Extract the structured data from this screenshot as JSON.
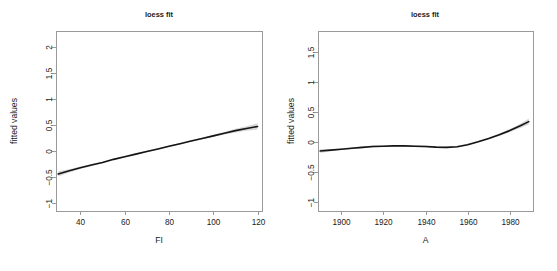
{
  "figure": {
    "background": "#ffffff",
    "line_color": "#141414",
    "band_color": "#c9c9c9",
    "axis_color": "#9a9a9a",
    "text_color": "#1a1a1a"
  },
  "panels": [
    {
      "id": "left",
      "title": "loess fit",
      "xlabel": "FI",
      "ylabel": "fitted values",
      "xticks": [
        "40",
        "60",
        "80",
        "100",
        "120"
      ],
      "yticks": [
        "2.0",
        "1.5",
        "1.0",
        "0.5",
        "0.0",
        "-0.5",
        "-1.0"
      ]
    },
    {
      "id": "right",
      "title": "loess fit",
      "xlabel": "A",
      "ylabel": "fitted values",
      "xticks": [
        "1900",
        "1920",
        "1940",
        "1960",
        "1980"
      ],
      "yticks": [
        "1.5",
        "1.0",
        "0.5",
        "0.0",
        "-0.5",
        "-1.0"
      ]
    }
  ],
  "chart_data": [
    {
      "type": "line",
      "panel": "left",
      "title": "loess fit",
      "xlabel": "FI",
      "ylabel": "fitted values",
      "xlim": [
        29,
        122
      ],
      "ylim": [
        -1.15,
        2.3
      ],
      "xticks": [
        40,
        60,
        80,
        100,
        120
      ],
      "yticks": [
        2.0,
        1.5,
        1.0,
        0.5,
        0.0,
        -0.5,
        -1.0
      ],
      "grid": false,
      "legend": "none",
      "series": [
        {
          "name": "loess fitted values",
          "x": [
            30,
            35,
            40,
            45,
            50,
            55,
            60,
            65,
            70,
            75,
            80,
            85,
            90,
            95,
            100,
            105,
            110,
            115,
            120
          ],
          "y": [
            -0.44,
            -0.38,
            -0.32,
            -0.27,
            -0.22,
            -0.16,
            -0.11,
            -0.06,
            -0.01,
            0.04,
            0.09,
            0.14,
            0.19,
            0.24,
            0.29,
            0.34,
            0.39,
            0.43,
            0.47
          ],
          "ci_lower": [
            -0.49,
            -0.41,
            -0.345,
            -0.29,
            -0.235,
            -0.175,
            -0.125,
            -0.075,
            -0.025,
            0.025,
            0.075,
            0.125,
            0.175,
            0.225,
            0.27,
            0.315,
            0.355,
            0.39,
            0.41
          ],
          "ci_upper": [
            -0.39,
            -0.35,
            -0.295,
            -0.25,
            -0.205,
            -0.145,
            -0.095,
            -0.045,
            0.005,
            0.055,
            0.105,
            0.155,
            0.205,
            0.255,
            0.31,
            0.365,
            0.425,
            0.475,
            0.53
          ]
        }
      ]
    },
    {
      "type": "line",
      "panel": "right",
      "title": "loess fit",
      "xlabel": "A",
      "ylabel": "fitted values",
      "xlim": [
        1889,
        1991
      ],
      "ylim": [
        -1.15,
        1.85
      ],
      "xticks": [
        1900,
        1920,
        1940,
        1960,
        1980
      ],
      "yticks": [
        1.5,
        1.0,
        0.5,
        0.0,
        -0.5,
        -1.0
      ],
      "grid": false,
      "legend": "none",
      "series": [
        {
          "name": "loess fitted values",
          "x": [
            1890,
            1895,
            1900,
            1905,
            1910,
            1915,
            1920,
            1925,
            1930,
            1935,
            1940,
            1945,
            1950,
            1955,
            1960,
            1965,
            1970,
            1975,
            1980,
            1985,
            1989
          ],
          "y": [
            -0.15,
            -0.135,
            -0.12,
            -0.105,
            -0.09,
            -0.075,
            -0.07,
            -0.065,
            -0.065,
            -0.07,
            -0.075,
            -0.085,
            -0.09,
            -0.08,
            -0.045,
            0.005,
            0.06,
            0.12,
            0.19,
            0.27,
            0.34
          ],
          "ci_lower": [
            -0.185,
            -0.155,
            -0.135,
            -0.12,
            -0.105,
            -0.09,
            -0.085,
            -0.08,
            -0.08,
            -0.085,
            -0.09,
            -0.1,
            -0.105,
            -0.095,
            -0.06,
            -0.01,
            0.045,
            0.1,
            0.165,
            0.235,
            0.29
          ],
          "ci_upper": [
            -0.115,
            -0.115,
            -0.105,
            -0.09,
            -0.075,
            -0.06,
            -0.055,
            -0.05,
            -0.05,
            -0.055,
            -0.06,
            -0.07,
            -0.075,
            -0.065,
            -0.03,
            0.02,
            0.075,
            0.14,
            0.215,
            0.305,
            0.39
          ]
        }
      ]
    }
  ]
}
